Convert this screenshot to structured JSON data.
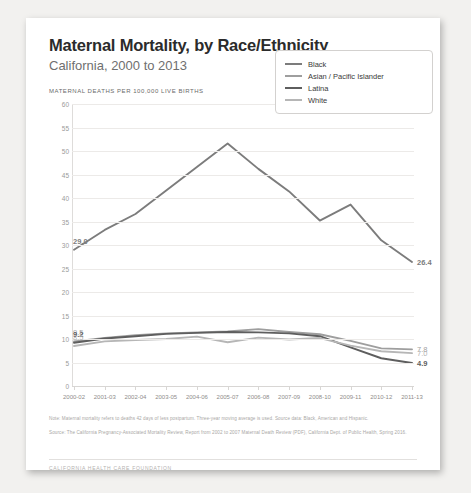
{
  "document": {
    "title": "Maternal Mortality, by Race/Ethnicity",
    "subtitle": "California, 2000 to 2013",
    "axis_note": "MATERNAL DEATHS PER 100,000 LIVE BIRTHS",
    "footnote_1": "Note: Maternal mortality refers to deaths 42 days of less postpartum. Three-year moving average is used. Source data: Black, American and Hispanic.",
    "footnote_2": "Source: The California Pregnancy-Associated Mortality Review, Report from 2002 to 2007 Maternal Death Review (PDF), California Dept. of Public Health, Spring 2016.",
    "brand": "CALIFORNIA HEALTH CARE FOUNDATION"
  },
  "colors": {
    "black_series": "#7c7c7c",
    "asian_series": "#9e9e9e",
    "latina_series": "#5e5e5e",
    "white_series": "#b6b6b6",
    "grid": "#eceae8",
    "text": "#2b2b2b"
  },
  "chart_data": {
    "type": "line",
    "title": "Maternal Mortality, by Race/Ethnicity",
    "subtitle": "California, 2000 to 2013",
    "xlabel": "",
    "ylabel": "MATERNAL DEATHS PER 100,000 LIVE BIRTHS",
    "ylim": [
      0,
      60
    ],
    "yticks": [
      0,
      5,
      10,
      15,
      20,
      25,
      30,
      35,
      40,
      45,
      50,
      55,
      60
    ],
    "grid": true,
    "legend_position": "top-right",
    "categories": [
      "2000-02",
      "2001-03",
      "2002-04",
      "2003-05",
      "2004-06",
      "2005-07",
      "2006-08",
      "2007-09",
      "2008-10",
      "2009-11",
      "2010-12",
      "2011-13"
    ],
    "series": [
      {
        "name": "Black",
        "color": "#7c7c7c",
        "values": [
          29.0,
          33.2,
          36.6,
          41.6,
          46.6,
          51.6,
          46.2,
          41.4,
          35.2,
          38.6,
          31.0,
          26.4
        ],
        "start_label": "29.0",
        "end_label": "26.4"
      },
      {
        "name": "Asian / Pacific Islander",
        "color": "#9e9e9e",
        "values": [
          9.5,
          10.2,
          10.8,
          11.2,
          11.4,
          11.6,
          12.1,
          11.5,
          11.0,
          9.6,
          8.0,
          7.8
        ],
        "start_label": "9.5",
        "end_label": "7.8"
      },
      {
        "name": "Latina",
        "color": "#5e5e5e",
        "values": [
          9.2,
          10.1,
          10.6,
          11.1,
          11.3,
          11.5,
          11.4,
          11.2,
          10.6,
          8.2,
          5.9,
          4.9
        ],
        "start_label": "9.2",
        "end_label": "4.9"
      },
      {
        "name": "White",
        "color": "#b6b6b6",
        "values": [
          8.5,
          9.5,
          9.8,
          10.0,
          10.5,
          9.3,
          10.3,
          9.9,
          10.2,
          8.6,
          7.4,
          7.0
        ],
        "start_label": "8.5",
        "end_label": "7.0"
      }
    ]
  }
}
